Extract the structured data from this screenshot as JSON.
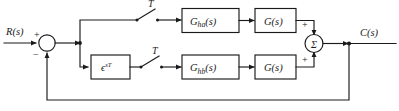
{
  "diagram": {
    "type": "control-block-diagram",
    "background_color": "#ffffff",
    "line_color": "#1a1a1a",
    "signals": {
      "input_label": "R(s)",
      "output_label": "C(s)"
    },
    "input_sum": {
      "name": "error-summing-junction",
      "plus_sign": "+",
      "minus_sign": "−",
      "symbol": ""
    },
    "output_sum": {
      "name": "output-summing-junction",
      "symbol": "Σ",
      "top_sign": "+",
      "bottom_sign": "+"
    },
    "samplers": [
      {
        "name": "sampler-upper",
        "label": "T"
      },
      {
        "name": "sampler-lower",
        "label": "T"
      }
    ],
    "blocks": [
      {
        "name": "delay-block",
        "base": "ϵ",
        "sup": "sT",
        "full": "ϵ^{sT}"
      },
      {
        "name": "hold-a-block",
        "base": "G",
        "sub": "ha",
        "paren": "(s)",
        "full": "G_ha(s)"
      },
      {
        "name": "plant-a-block",
        "base": "G",
        "paren": "(s)",
        "full": "G(s)"
      },
      {
        "name": "hold-b-block",
        "base": "G",
        "sub": "hb",
        "paren": "(s)",
        "full": "G_hb(s)"
      },
      {
        "name": "plant-b-block",
        "base": "G",
        "paren": "(s)",
        "full": "G(s)"
      }
    ],
    "feedback": {
      "name": "unity-feedback-path",
      "label": ""
    }
  }
}
